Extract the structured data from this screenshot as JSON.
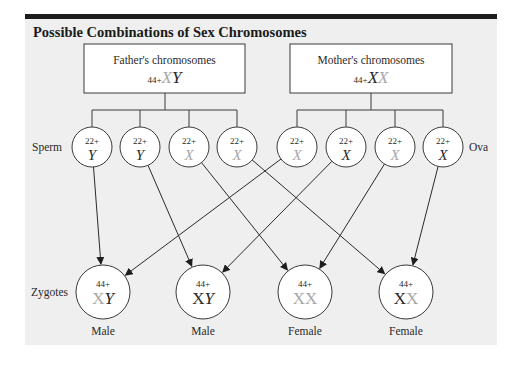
{
  "title": "Possible Combinations of Sex Chromosomes",
  "colors": {
    "panel_bg": "#efefef",
    "top_bar": "#1c1c1c",
    "line": "#3a3a3a",
    "dark_chrom": "#2a2a2a",
    "light_chrom": "#a8a8a8"
  },
  "parents": {
    "father": {
      "label": "Father's chromosomes",
      "autosomes": "44+",
      "sex": [
        {
          "c": "X",
          "tone": "light"
        },
        {
          "c": "Y",
          "tone": "dark"
        }
      ]
    },
    "mother": {
      "label": "Mother's chromosomes",
      "autosomes": "44+",
      "sex": [
        {
          "c": "X",
          "tone": "dark"
        },
        {
          "c": "X",
          "tone": "light"
        }
      ]
    }
  },
  "row_labels": {
    "sperm": "Sperm",
    "ova": "Ova",
    "zygotes": "Zygotes"
  },
  "sperm": [
    {
      "autosomes": "22+",
      "sex": "Y",
      "tone": "dark"
    },
    {
      "autosomes": "22+",
      "sex": "Y",
      "tone": "dark"
    },
    {
      "autosomes": "22+",
      "sex": "X",
      "tone": "light"
    },
    {
      "autosomes": "22+",
      "sex": "X",
      "tone": "light"
    }
  ],
  "ova": [
    {
      "autosomes": "22+",
      "sex": "X",
      "tone": "light"
    },
    {
      "autosomes": "22+",
      "sex": "X",
      "tone": "dark"
    },
    {
      "autosomes": "22+",
      "sex": "X",
      "tone": "light"
    },
    {
      "autosomes": "22+",
      "sex": "X",
      "tone": "dark"
    }
  ],
  "zygotes": [
    {
      "autosomes": "44+",
      "sex": [
        {
          "c": "X",
          "tone": "light"
        },
        {
          "c": "Y",
          "tone": "dark"
        }
      ],
      "label": "Male"
    },
    {
      "autosomes": "44+",
      "sex": [
        {
          "c": "X",
          "tone": "dark"
        },
        {
          "c": "Y",
          "tone": "dark"
        }
      ],
      "label": "Male"
    },
    {
      "autosomes": "44+",
      "sex": [
        {
          "c": "X",
          "tone": "light"
        },
        {
          "c": "X",
          "tone": "light"
        }
      ],
      "label": "Female"
    },
    {
      "autosomes": "44+",
      "sex": [
        {
          "c": "X",
          "tone": "dark"
        },
        {
          "c": "X",
          "tone": "light"
        }
      ],
      "label": "Female"
    }
  ],
  "arrows": [
    {
      "from": "sperm.0",
      "to": "zygotes.0"
    },
    {
      "from": "sperm.1",
      "to": "zygotes.1"
    },
    {
      "from": "sperm.2",
      "to": "zygotes.2"
    },
    {
      "from": "sperm.3",
      "to": "zygotes.3"
    },
    {
      "from": "ova.0",
      "to": "zygotes.0"
    },
    {
      "from": "ova.1",
      "to": "zygotes.1"
    },
    {
      "from": "ova.2",
      "to": "zygotes.2"
    },
    {
      "from": "ova.3",
      "to": "zygotes.3"
    }
  ]
}
